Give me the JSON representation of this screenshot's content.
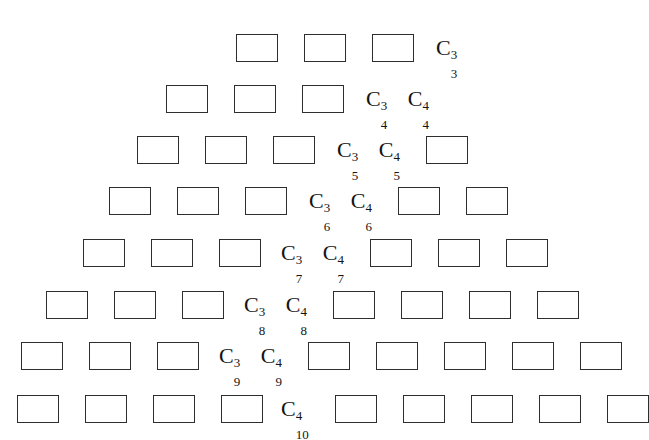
{
  "figure": {
    "clipped_caption_text": "— 一 一 一 一 一 一 一 一 一 一 一 一 一 一 一 一 一 一 一 一",
    "box_width_px": 42,
    "box_height_px": 28,
    "box_border_color": "#2e2e2e",
    "background_color": "#ffffff",
    "label_color": "#141414",
    "rows": [
      {
        "id": "row-1",
        "top_px": 26,
        "left_px": 236,
        "leading_boxes": 3,
        "label": {
          "base": "C",
          "sup": "3",
          "sub": "3",
          "text": "C_3^3"
        },
        "label_gap_px": 22,
        "second_label": null,
        "trailing_boxes": 0
      },
      {
        "id": "row-2",
        "top_px": 77,
        "left_px": 166,
        "leading_boxes": 3,
        "label": {
          "base": "C",
          "sup": "3",
          "sub": "4",
          "text": "C_4^3"
        },
        "label_gap_px": 22,
        "second_label": {
          "base": "C",
          "sup": "4",
          "sub": "4",
          "text": "C_4^4"
        },
        "trailing_boxes": 0
      },
      {
        "id": "row-3",
        "top_px": 128,
        "left_px": 137,
        "leading_boxes": 3,
        "label": {
          "base": "C",
          "sup": "3",
          "sub": "5",
          "text": "C_5^3"
        },
        "label_gap_px": 22,
        "second_label": {
          "base": "C",
          "sup": "4",
          "sub": "5",
          "text": "C_5^4"
        },
        "trailing_boxes": 1
      },
      {
        "id": "row-4",
        "top_px": 179,
        "left_px": 109,
        "leading_boxes": 3,
        "label": {
          "base": "C",
          "sup": "3",
          "sub": "6",
          "text": "C_6^3"
        },
        "label_gap_px": 22,
        "second_label": {
          "base": "C",
          "sup": "4",
          "sub": "6",
          "text": "C_6^4"
        },
        "trailing_boxes": 2
      },
      {
        "id": "row-5",
        "top_px": 231,
        "left_px": 83,
        "leading_boxes": 3,
        "label": {
          "base": "C",
          "sup": "3",
          "sub": "7",
          "text": "C_7^3"
        },
        "label_gap_px": 20,
        "second_label": {
          "base": "C",
          "sup": "4",
          "sub": "7",
          "text": "C_7^4"
        },
        "trailing_boxes": 3
      },
      {
        "id": "row-6",
        "top_px": 283,
        "left_px": 46,
        "leading_boxes": 3,
        "label": {
          "base": "C",
          "sup": "3",
          "sub": "8",
          "text": "C_8^3"
        },
        "label_gap_px": 20,
        "second_label": {
          "base": "C",
          "sup": "4",
          "sub": "8",
          "text": "C_8^4"
        },
        "trailing_boxes": 4
      },
      {
        "id": "row-7",
        "top_px": 334,
        "left_px": 21,
        "leading_boxes": 3,
        "label": {
          "base": "C",
          "sup": "3",
          "sub": "9",
          "text": "C_9^3"
        },
        "label_gap_px": 20,
        "second_label": {
          "base": "C",
          "sup": "4",
          "sub": "9",
          "text": "C_9^4"
        },
        "trailing_boxes": 5
      },
      {
        "id": "row-8",
        "top_px": 387,
        "left_px": 17,
        "leading_boxes": 4,
        "label": {
          "base": "C",
          "sup": "4",
          "sub": "10",
          "text": "C_10^4"
        },
        "label_gap_px": 18,
        "second_label": null,
        "trailing_boxes": 5
      }
    ]
  }
}
